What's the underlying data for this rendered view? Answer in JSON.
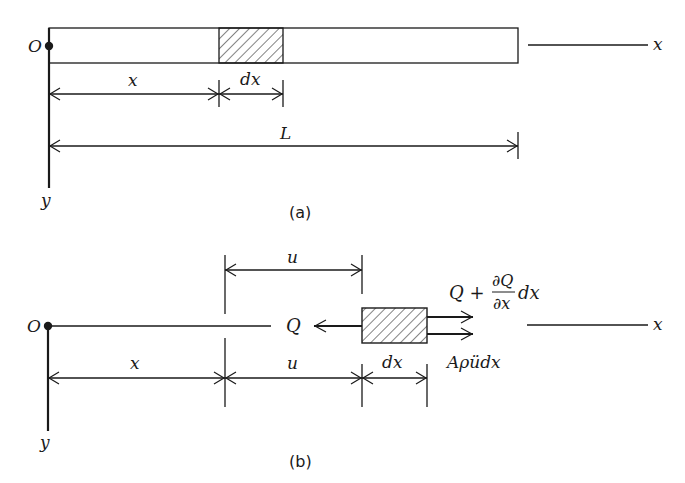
{
  "figure": {
    "panel_a": {
      "caption": "(a)",
      "origin_label": "O",
      "x_axis_label": "x",
      "y_axis_label": "y",
      "element_width_label": "dx",
      "position_label": "x",
      "length_label": "L"
    },
    "panel_b": {
      "caption": "(b)",
      "origin_label": "O",
      "x_axis_label": "x",
      "y_axis_label": "y",
      "displacement_top_label": "u",
      "displacement_bottom_label": "u",
      "position_label": "x",
      "element_width_label": "dx",
      "left_force_label": "Q",
      "right_force_label_main": "Q +",
      "right_force_fraction_num": "∂Q",
      "right_force_fraction_den": "∂x",
      "right_force_label_tail": "dx",
      "inertia_force_label": "Aρüdx"
    }
  },
  "colors": {
    "stroke": "#1a1a1a",
    "background": "#ffffff"
  }
}
